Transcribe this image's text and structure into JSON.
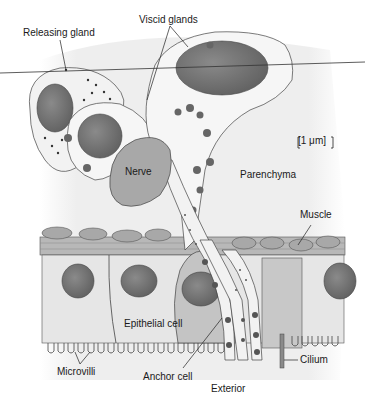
{
  "figure": {
    "type": "biological-cell-diagram",
    "scale_bar": "[1 μm]",
    "labels": {
      "releasing_gland": "Releasing gland",
      "viscid_glands": "Viscid glands",
      "nerve": "Nerve",
      "parenchyma": "Parenchyma",
      "muscle": "Muscle",
      "epithelial_cell": "Epithelial cell",
      "microvilli": "Microvilli",
      "anchor_cell": "Anchor cell",
      "cilium": "Cilium",
      "exterior": "Exterior"
    },
    "colors": {
      "background": "#ffffff",
      "parenchyma_bg": "#eeeeee",
      "cytoplasm": "#f4f4f4",
      "nucleus": "#707070",
      "nerve": "#a8a8a8",
      "epithelium": "#e6e6e6",
      "anchor_cell": "#c4c4c4",
      "muscle": "#b8b8b8",
      "granule": "#555555",
      "outline": "#444444"
    }
  }
}
